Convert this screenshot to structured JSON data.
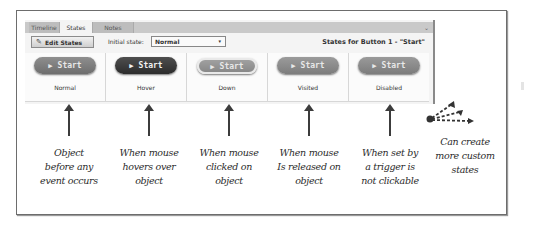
{
  "tabs": [
    {
      "label": "Timeline",
      "active": false
    },
    {
      "label": "States",
      "active": true
    },
    {
      "label": "Notes",
      "active": false
    }
  ],
  "toolbar": {
    "edit_states_label": "Edit States",
    "initial_state_label": "Initial state:",
    "initial_state_value": "Normal",
    "states_title": "States for Button 1 - \"Start\""
  },
  "states": [
    {
      "button_label": "Start",
      "name": "Normal",
      "style": "normal"
    },
    {
      "button_label": "Start",
      "name": "Hover",
      "style": "hover"
    },
    {
      "button_label": "Start",
      "name": "Down",
      "style": "down"
    },
    {
      "button_label": "Start",
      "name": "Visited",
      "style": "visited"
    },
    {
      "button_label": "Start",
      "name": "Disabled",
      "style": "disabled"
    }
  ],
  "annotations": [
    {
      "lines": [
        "Object",
        "before any",
        "event occurs"
      ]
    },
    {
      "lines": [
        "When mouse",
        "hovers over",
        "object"
      ]
    },
    {
      "lines": [
        "When mouse",
        "clicked on",
        "object"
      ]
    },
    {
      "lines": [
        "When mouse",
        "Is released on",
        "object"
      ]
    },
    {
      "lines": [
        "When set  by",
        "a trigger is",
        "not clickable"
      ]
    }
  ],
  "custom_annotation": {
    "lines": [
      "Can create",
      "more custom",
      "states"
    ]
  },
  "icons": {
    "play": "▶",
    "pencil": "✎",
    "dropdown_caret": "▾",
    "tab_chevron": "⌄"
  },
  "colors": {
    "frame_border": "#6d6d6d",
    "panel_bg": "#f4f4f4",
    "tabbar_bg": "#c9c9c9",
    "hover_button": "#3a3a3a",
    "normal_button": "#7e7e7e",
    "annotation_ink": "#2b2b2b"
  }
}
